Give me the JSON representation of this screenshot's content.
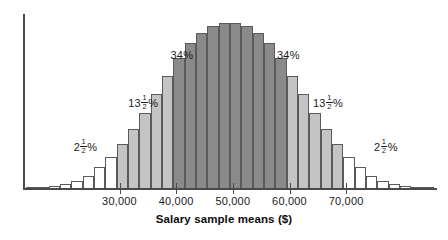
{
  "chart_data": {
    "type": "bar",
    "title": "",
    "subtitle": "",
    "xlabel": "Salary sample means ($)",
    "ylabel": "",
    "grid": false,
    "legend": "none",
    "axis": {
      "x_tick_values": [
        30000,
        40000,
        50000,
        60000,
        70000
      ],
      "x_tick_labels": [
        "30,000",
        "40,000",
        "50,000",
        "60,000",
        "70,000"
      ],
      "x_range": [
        13500,
        85500
      ],
      "y_range": [
        0,
        100
      ],
      "y_ticks_shown": false
    },
    "bin_width": 2000,
    "categories": [
      "14,000",
      "16,000",
      "18,000",
      "20,000",
      "22,000",
      "24,000",
      "26,000",
      "28,000",
      "30,000",
      "32,000",
      "34,000",
      "36,000",
      "38,000",
      "40,000",
      "42,000",
      "44,000",
      "46,000",
      "48,000",
      "50,000",
      "52,000",
      "54,000",
      "56,000",
      "58,000",
      "60,000",
      "62,000",
      "64,000",
      "66,000",
      "68,000",
      "70,000",
      "72,000",
      "74,000",
      "76,000",
      "78,000",
      "80,000",
      "82,000",
      "84,000"
    ],
    "values": [
      1,
      1,
      2,
      3,
      5,
      8,
      13,
      19,
      27,
      36,
      46,
      57,
      68,
      79,
      88,
      94,
      98,
      100,
      100,
      98,
      94,
      88,
      79,
      68,
      57,
      46,
      36,
      27,
      19,
      13,
      8,
      5,
      3,
      2,
      1,
      1
    ],
    "bar_fills": [
      "white",
      "white",
      "white",
      "white",
      "white",
      "white",
      "white",
      "white",
      "light",
      "light",
      "light",
      "light",
      "light",
      "dark",
      "dark",
      "dark",
      "dark",
      "dark",
      "dark",
      "dark",
      "dark",
      "dark",
      "dark",
      "light",
      "light",
      "light",
      "light",
      "light",
      "white",
      "white",
      "white",
      "white",
      "white",
      "white",
      "white",
      "white"
    ],
    "annotations": [
      {
        "id": "left-outer",
        "text": "2½%",
        "whole": "2",
        "numerator": "1",
        "denominator": "2",
        "suffix": "%",
        "x_value": 24000,
        "y_frac": 0.3
      },
      {
        "id": "left-mid",
        "text": "13½%",
        "whole": "13",
        "numerator": "1",
        "denominator": "2",
        "suffix": "%",
        "x_value": 34200,
        "y_frac": 0.565
      },
      {
        "id": "left-inner",
        "text": "34%",
        "whole": "34",
        "numerator": "",
        "denominator": "",
        "suffix": "%",
        "x_value": 41000,
        "y_frac": 0.845
      },
      {
        "id": "right-inner",
        "text": "34%",
        "whole": "34",
        "numerator": "",
        "denominator": "",
        "suffix": "%",
        "x_value": 59800,
        "y_frac": 0.845
      },
      {
        "id": "right-mid",
        "text": "13½%",
        "whole": "13",
        "numerator": "1",
        "denominator": "2",
        "suffix": "%",
        "x_value": 66800,
        "y_frac": 0.565
      },
      {
        "id": "right-outer",
        "text": "2½%",
        "whole": "2",
        "numerator": "1",
        "denominator": "2",
        "suffix": "%",
        "x_value": 77000,
        "y_frac": 0.3
      }
    ],
    "colors": {
      "dark_fill": "#8a8a8a",
      "light_fill": "#c4c4c4",
      "white_fill": "#ffffff",
      "bar_edge": "#5a5a5a",
      "axis": "#4a4a4a",
      "text": "#1a1a1a",
      "background": "#ffffff"
    }
  }
}
